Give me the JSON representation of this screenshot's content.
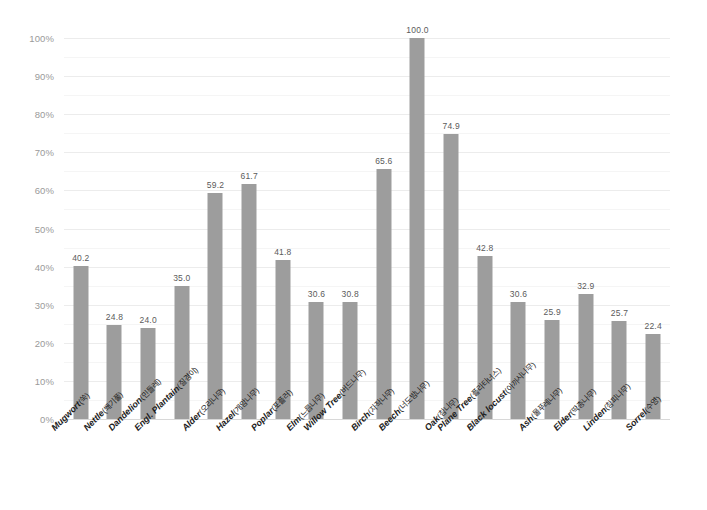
{
  "chart_data": {
    "type": "bar",
    "title": "",
    "subtitle": "",
    "xlabel": "",
    "ylabel": "",
    "ylim": [
      0,
      100
    ],
    "ytick_suffix": "%",
    "grid": true,
    "grid_major_step": 10,
    "grid_minor_step": 5,
    "legend": "none",
    "bar_color": "#9d9d9d",
    "value_label_color": "#5b5b5b",
    "gridline_color": "#ececec",
    "axis_label_color": "#9a9a9a",
    "category_label_color": "#1d1d1d",
    "background_color": "#ffffff",
    "ytick_labels": [
      "0%",
      "10%",
      "20%",
      "30%",
      "40%",
      "50%",
      "60%",
      "70%",
      "80%",
      "90%",
      "100%"
    ],
    "ytick_values": [
      0,
      10,
      20,
      30,
      40,
      50,
      60,
      70,
      80,
      90,
      100
    ],
    "categories": [
      "Mugwort(쑥)",
      "Nettle(쐐기풀)",
      "Dandelion(민들레)",
      "Engl. Plantain(질경이)",
      "Alder(오리나무)",
      "Hazel(개암나무)",
      "Poplar(포플러)",
      "Elm(느릅나무)",
      "Willow Tree(버드나무)",
      "Birch(자작나무)",
      "Beech(너도밤나무)",
      "Oak(참나무)",
      "Plane Tree(플라타너스)",
      "Black locust(아까시나무)",
      "Ash(물푸레나무)",
      "Elder(딱총나무)",
      "Linden(참피나무)",
      "Sorrel(수영)"
    ],
    "categories_latin": [
      "Mugwort",
      "Nettle",
      "Dandelion",
      "Engl. Plantain",
      "Alder",
      "Hazel",
      "Poplar",
      "Elm",
      "Willow Tree",
      "Birch",
      "Beech",
      "Oak",
      "Plane Tree",
      "Black locust",
      "Ash",
      "Elder",
      "Linden",
      "Sorrel"
    ],
    "categories_korean": [
      "(쑥)",
      "(쐐기풀)",
      "(민들레)",
      "(질경이)",
      "(오리나무)",
      "(개암나무)",
      "(포플러)",
      "(느릅나무)",
      "(버드나무)",
      "(자작나무)",
      "(너도밤나무)",
      "(참나무)",
      "(플라타너스)",
      "(아까시나무)",
      "(물푸레나무)",
      "(딱총나무)",
      "(참피나무)",
      "(수영)"
    ],
    "values": [
      40.2,
      24.8,
      24.0,
      35.0,
      59.2,
      61.7,
      41.8,
      30.6,
      30.8,
      65.6,
      100.0,
      74.9,
      42.8,
      30.6,
      25.9,
      32.9,
      25.7,
      22.4
    ],
    "value_labels": [
      "40.2",
      "24.8",
      "24.0",
      "35.0",
      "59.2",
      "61.7",
      "41.8",
      "30.6",
      "30.8",
      "65.6",
      "100.0",
      "74.9",
      "42.8",
      "30.6",
      "25.9",
      "32.9",
      "25.7",
      "22.4"
    ]
  }
}
